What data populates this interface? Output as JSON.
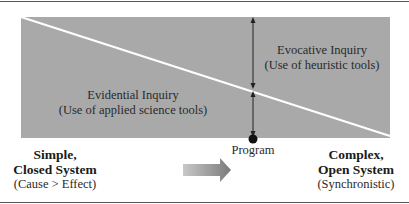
{
  "diagram": {
    "regions": {
      "upper": {
        "title": "Evocative Inquiry",
        "subtitle": "(Use of heuristic tools)"
      },
      "lower": {
        "title": "Evidential Inquiry",
        "subtitle": "(Use of applied science tools)"
      }
    },
    "marker": {
      "label": "Program",
      "icon": "filled-circle"
    },
    "left_pole": {
      "line1": "Simple,",
      "line2": "Closed System",
      "note": "(Cause > Effect)"
    },
    "right_pole": {
      "line1": "Complex,",
      "line2": "Open System",
      "note": "(Synchronistic)"
    },
    "direction_arrow": {
      "icon": "right-arrow",
      "direction": "left-to-right"
    },
    "colors": {
      "panel": "#a9a9a9",
      "divider": "#ffffff",
      "text": "#222222"
    }
  }
}
